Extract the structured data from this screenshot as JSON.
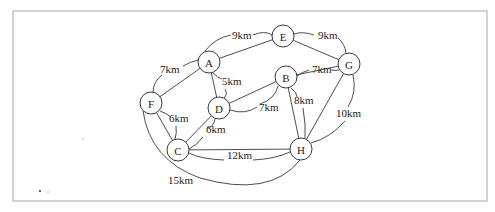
{
  "diagram": {
    "type": "weighted-undirected-graph",
    "unit": "km",
    "frame": {
      "x": 13,
      "y": 11,
      "width": 474,
      "height": 190
    },
    "node_radius": 11,
    "nodes": [
      {
        "id": "A",
        "label": "A",
        "x": 209,
        "y": 62
      },
      {
        "id": "E",
        "label": "E",
        "x": 283,
        "y": 36
      },
      {
        "id": "G",
        "label": "G",
        "x": 349,
        "y": 64
      },
      {
        "id": "B",
        "label": "B",
        "x": 286,
        "y": 77
      },
      {
        "id": "D",
        "label": "D",
        "x": 219,
        "y": 108
      },
      {
        "id": "F",
        "label": "F",
        "x": 151,
        "y": 103
      },
      {
        "id": "C",
        "label": "C",
        "x": 178,
        "y": 150
      },
      {
        "id": "H",
        "label": "H",
        "x": 301,
        "y": 149
      }
    ],
    "edges": [
      {
        "from": "A",
        "to": "E",
        "weight": 9,
        "label": "9km",
        "lx": 232,
        "ly": 39,
        "leader": "M 205 51 Q 215 38 231 35 M 253 35 Q 265 30 272 35"
      },
      {
        "from": "E",
        "to": "G",
        "weight": 9,
        "label": "9km",
        "lx": 318,
        "ly": 39,
        "leader": "M 294 34 Q 303 31 314 35 M 338 38 Q 345 44 346 53"
      },
      {
        "from": "A",
        "to": "F",
        "weight": 7,
        "label": "7km",
        "lx": 160,
        "ly": 73,
        "leader": "M 198 60 Q 190 62 183 66 M 162 75 Q 153 82 153 92"
      },
      {
        "from": "A",
        "to": "D",
        "weight": 5,
        "label": "5km",
        "lx": 222,
        "ly": 85,
        "leader": "M 213 73 Q 218 78 222 79 M 225 89 Q 228 94 224 98"
      },
      {
        "from": "B",
        "to": "G",
        "weight": 7,
        "label": "7km",
        "lx": 312,
        "ly": 73,
        "leader": "M 297 76 Q 302 72 309 70 M 331 70 Q 335 71 339 70"
      },
      {
        "from": "B",
        "to": "D",
        "weight": 7,
        "label": "7km",
        "lx": 259,
        "ly": 111,
        "leader": "M 278 86 Q 275 99 260 104 M 257 107 Q 245 115 230 110"
      },
      {
        "from": "B",
        "to": "H",
        "weight": 8,
        "label": "8km",
        "lx": 294,
        "ly": 104,
        "leader": "M 291 88 Q 297 92 297 97 M 303 108 Q 306 125 305 138"
      },
      {
        "from": "G",
        "to": "H",
        "weight": 10,
        "label": "10km",
        "lx": 336,
        "ly": 117,
        "leader": "M 353 75 Q 357 92 348 107 M 345 121 Q 330 138 311 143"
      },
      {
        "from": "F",
        "to": "C",
        "weight": 6,
        "label": "6km",
        "lx": 169,
        "ly": 122,
        "leader": "M 160 111 Q 166 113 171 117 M 176 126 Q 177 133 175 139"
      },
      {
        "from": "D",
        "to": "C",
        "weight": 6,
        "label": "6km",
        "lx": 206,
        "ly": 133,
        "leader": "M 215 119 Q 213 128 207 128 M 203 137 Q 197 145 189 149"
      },
      {
        "from": "C",
        "to": "H",
        "weight": 12,
        "label": "12km",
        "lx": 227,
        "ly": 159,
        "leader": "M 189 153 Q 200 159 224 160 M 253 160 Q 275 159 290 152"
      },
      {
        "from": "F",
        "to": "H",
        "weight": 15,
        "label": "15km",
        "lx": 168,
        "ly": 184,
        "leader": "M 143 111 Q 140 150 170 170 M 194 181 Q 260 200 302 160"
      }
    ],
    "specks": [
      {
        "x": 40,
        "y": 191,
        "r": 1.0
      },
      {
        "x": 48,
        "y": 192,
        "r": 0.5
      },
      {
        "x": 83,
        "y": 139,
        "r": 0.5
      }
    ]
  }
}
